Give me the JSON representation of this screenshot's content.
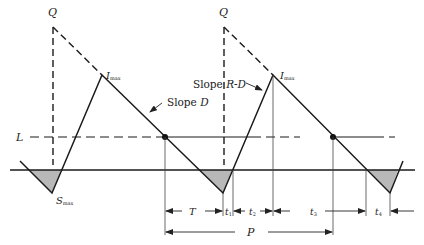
{
  "diagram": {
    "type": "inventory-cycle-sawtooth",
    "labels": {
      "q_left": "Q",
      "q_right": "Q",
      "imax_left": "I",
      "imax_left_sub": "max",
      "imax_right": "I",
      "imax_right_sub": "max",
      "smax": "S",
      "smax_sub": "max",
      "reorder_level": "L",
      "slope_d_prefix": "Slope ",
      "slope_d_var": "D",
      "slope_rd_prefix": "Slope ",
      "slope_rd_var": "R-D"
    },
    "dimensions": {
      "T": "T",
      "t1": "t",
      "t1_sub": "1",
      "t2": "t",
      "t2_sub": "2",
      "t3": "t",
      "t3_sub": "3",
      "t4": "t",
      "t4_sub": "4",
      "P": "P"
    },
    "colors": {
      "line": "#1a1a1a",
      "shortage_fill": "#b8b8b8",
      "dim_line": "#444444"
    }
  }
}
